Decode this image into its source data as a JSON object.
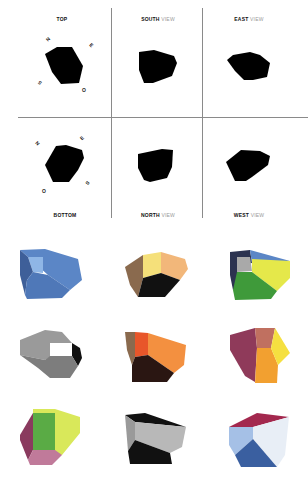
{
  "orthographic_views": {
    "top": {
      "label": "TOP"
    },
    "south": {
      "label_bold": "SOUTH",
      "label_light": "VIEW"
    },
    "east": {
      "label_bold": "EAST",
      "label_light": "VIEW"
    },
    "bottom": {
      "label": "BOTTOM"
    },
    "north": {
      "label_bold": "NORTH",
      "label_light": "VIEW"
    },
    "west": {
      "label_bold": "WEST",
      "label_light": "VIEW"
    },
    "silhouette_color": "#000000",
    "grid_line_color": "#8a8a8a"
  },
  "compass_marks": {
    "top": [
      "N",
      "E",
      "S",
      "O"
    ],
    "bottom": [
      "N",
      "E",
      "S",
      "O"
    ]
  },
  "colored_solids": [
    {
      "row": 1,
      "col": 1,
      "colors": [
        "#5b86c6",
        "#8fb6e6",
        "#4f78b8",
        "#3e5f99"
      ]
    },
    {
      "row": 1,
      "col": 2,
      "colors": [
        "#8a6a4e",
        "#f5e07a",
        "#f2b77a",
        "#111111"
      ]
    },
    {
      "row": 1,
      "col": 3,
      "colors": [
        "#2c3350",
        "#a9a9a9",
        "#5b86c6",
        "#e5e84a",
        "#3f9a3a"
      ]
    },
    {
      "row": 2,
      "col": 1,
      "colors": [
        "#9a9a9a",
        "#ffffff",
        "#111111",
        "#7d7d7d"
      ]
    },
    {
      "row": 2,
      "col": 2,
      "colors": [
        "#8a6a4e",
        "#e8562a",
        "#f39040",
        "#2a1612"
      ]
    },
    {
      "row": 2,
      "col": 3,
      "colors": [
        "#8f3a5a",
        "#c07060",
        "#f2a030",
        "#f5e040"
      ]
    },
    {
      "row": 3,
      "col": 1,
      "colors": [
        "#d9e85a",
        "#5aab45",
        "#8a3a5e",
        "#c07a9a"
      ]
    },
    {
      "row": 3,
      "col": 2,
      "colors": [
        "#111111",
        "#b8b8b8",
        "#9a9a9a"
      ]
    },
    {
      "row": 3,
      "col": 3,
      "colors": [
        "#a3284e",
        "#a5c0e6",
        "#e8eef6",
        "#3a5fa0"
      ]
    }
  ]
}
